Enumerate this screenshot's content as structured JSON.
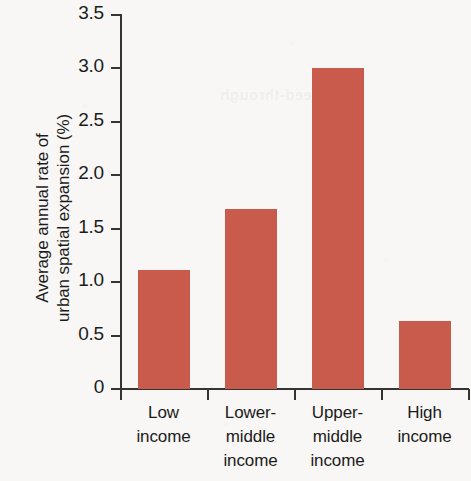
{
  "chart_data": {
    "type": "bar",
    "title": "",
    "subtitle": "",
    "xlabel": "",
    "ylabel": "Average annual rate of urban spatial expansion (%)",
    "ylabel_lines": [
      "Average annual rate of",
      "urban spatial expansion (%)"
    ],
    "categories": [
      "Low income",
      "Lower-middle income",
      "Upper-middle income",
      "High income"
    ],
    "category_lines": [
      [
        "Low",
        "income"
      ],
      [
        "Lower-",
        "middle",
        "income"
      ],
      [
        "Upper-",
        "middle",
        "income"
      ],
      [
        "High",
        "income"
      ]
    ],
    "values": [
      1.11,
      1.68,
      3.0,
      0.64
    ],
    "ylim": [
      0,
      3.5
    ],
    "ytick_labels": [
      "3.5",
      "3.0",
      "2.5",
      "2.0",
      "1.5",
      "1.0",
      "0.5",
      "0"
    ],
    "ytick_values": [
      3.5,
      3.0,
      2.5,
      2.0,
      1.5,
      1.0,
      0.5,
      0
    ],
    "grid": false,
    "legend": false,
    "legend_position": "none",
    "bar_color": "#c95b4c",
    "axis_color": "#343434",
    "text_color": "#1b1b1b",
    "background_color": "#f8f7f5"
  },
  "artifacts": {
    "ghost_text": "bleed-through"
  }
}
